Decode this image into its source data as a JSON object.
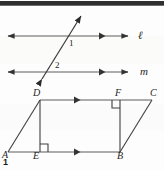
{
  "figure": {
    "number": "1",
    "caption_number": "1",
    "stroke_color": "#3a3a3a",
    "line_color_light": "#6b6b6b",
    "background": "#fdfdfd",
    "top_bar_color": "#2f2f2f"
  },
  "parallel_lines": {
    "line_top": {
      "label": "ℓ",
      "label_name": "line-l",
      "y": 36,
      "x_start": 8,
      "x_end": 128,
      "arrow_left": true,
      "arrow_right": true,
      "mid_arrow_x": 104
    },
    "line_bottom": {
      "label": "m",
      "label_name": "line-m",
      "y": 72,
      "x_start": 8,
      "x_end": 128,
      "arrow_left": true,
      "arrow_right": true,
      "mid_arrow_x": 104
    },
    "transversal": {
      "label": "transversal",
      "x1": 40,
      "y1": 83,
      "x2": 83,
      "y2": 12,
      "arrow_both_ends": true
    },
    "angles": [
      {
        "label": "1",
        "x": 69,
        "y": 39
      },
      {
        "label": "2",
        "x": 55,
        "y": 62
      }
    ]
  },
  "parallelogram": {
    "name": "parallelogram-abcd",
    "vertices": [
      {
        "label": "A",
        "x": 8,
        "y": 152,
        "text_x": 2,
        "text_y": 152
      },
      {
        "label": "B",
        "x": 120,
        "y": 152,
        "text_x": 117,
        "text_y": 154
      },
      {
        "label": "C",
        "x": 152,
        "y": 100,
        "text_x": 150,
        "text_y": 92
      },
      {
        "label": "D",
        "x": 40,
        "y": 100,
        "text_x": 33,
        "text_y": 92
      },
      {
        "label": "E",
        "x": 40,
        "y": 152,
        "text_x": 34,
        "text_y": 154
      },
      {
        "label": "F",
        "x": 120,
        "y": 100,
        "text_x": 116,
        "text_y": 92
      }
    ],
    "segments": [
      {
        "from": "D",
        "to": "C",
        "mid_arrow": true
      },
      {
        "from": "A",
        "to": "B",
        "mid_arrow": true
      },
      {
        "from": "A",
        "to": "D",
        "mid_arrow": false
      },
      {
        "from": "B",
        "to": "C",
        "mid_arrow": false
      },
      {
        "from": "D",
        "to": "E",
        "mid_arrow": false
      },
      {
        "from": "F",
        "to": "B",
        "mid_arrow": false
      },
      {
        "from": "E",
        "to": "B",
        "mid_arrow": false
      }
    ],
    "right_angles": [
      {
        "at": "E",
        "corner_x": 40,
        "corner_y": 152,
        "dir_x": 1,
        "dir_y": -1,
        "size": 8
      },
      {
        "at": "F",
        "corner_x": 120,
        "corner_y": 100,
        "dir_x": -1,
        "dir_y": 1,
        "size": 8
      }
    ]
  }
}
